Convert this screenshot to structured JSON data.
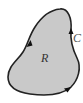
{
  "diagram": {
    "type": "region-with-boundary-curve",
    "region_label": "R",
    "curve_label": "C",
    "orientation": "counterclockwise",
    "colors": {
      "region_fill": "#c9c9c9",
      "curve_stroke": "#222222",
      "background": "#ffffff"
    },
    "arrows": [
      {
        "position": "left-side",
        "direction": "down"
      },
      {
        "position": "right-side",
        "direction": "up"
      },
      {
        "position": "bottom-right",
        "direction": "right"
      }
    ]
  }
}
